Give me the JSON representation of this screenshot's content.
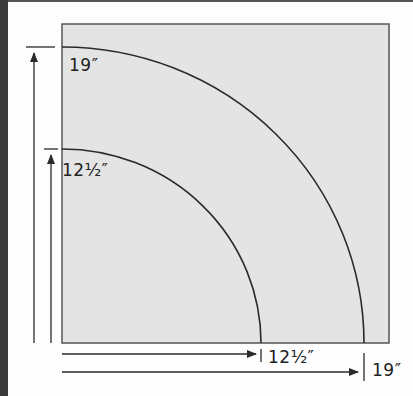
{
  "diagram": {
    "colors": {
      "block_fill": "#e4e4e4",
      "line": "#2a2a2a",
      "edge_strip": "#3a3a3a"
    },
    "labels": {
      "outer_vertical": "19″",
      "inner_vertical": "12½″",
      "inner_horizontal": "12½″",
      "outer_horizontal": "19″"
    },
    "arcs": [
      {
        "name": "outer-arc",
        "radius": "19″"
      },
      {
        "name": "inner-arc",
        "radius": "12½″"
      }
    ]
  }
}
